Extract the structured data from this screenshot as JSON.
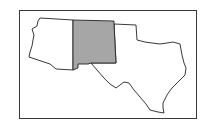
{
  "map": {
    "title": "Southwestern United States",
    "highlighted_state": "New Mexico",
    "colors": {
      "highlight_fill": "#a6a6a6",
      "default_fill": "#ffffff",
      "border": "#222222",
      "frame": "#3a3a3a"
    },
    "states": [
      {
        "name": "Arizona",
        "highlighted": false
      },
      {
        "name": "New Mexico",
        "highlighted": true
      },
      {
        "name": "Texas",
        "highlighted": false
      }
    ]
  }
}
